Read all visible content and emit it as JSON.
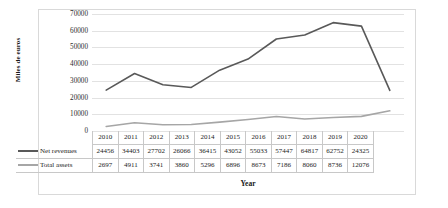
{
  "chart_data": {
    "type": "line",
    "title": "",
    "xlabel": "Year",
    "ylabel": "Miles de euros",
    "categories": [
      "2010",
      "2011",
      "2012",
      "2013",
      "2014",
      "2015",
      "2016",
      "2017",
      "2018",
      "2019",
      "2020"
    ],
    "series": [
      {
        "name": "Net revenues",
        "color": "#595959",
        "values": [
          24456,
          34403,
          27702,
          26066,
          36415,
          43052,
          55033,
          57447,
          64817,
          62752,
          24325
        ]
      },
      {
        "name": "Total assets",
        "color": "#a6a6a6",
        "values": [
          2697,
          4911,
          3741,
          3860,
          5296,
          6896,
          8673,
          7186,
          8060,
          8736,
          12076
        ]
      }
    ],
    "ylim": [
      0,
      70000
    ],
    "ytick_labels": [
      "70000",
      "60000",
      "50000",
      "40000",
      "30000",
      "20000",
      "10000",
      "0"
    ],
    "ytick_values": [
      70000,
      60000,
      50000,
      40000,
      30000,
      20000,
      10000,
      0
    ],
    "grid": true,
    "legend_position": "data-table-left",
    "gridline_color": "#e2e2e2",
    "frame_color": "#d9d9d9"
  }
}
